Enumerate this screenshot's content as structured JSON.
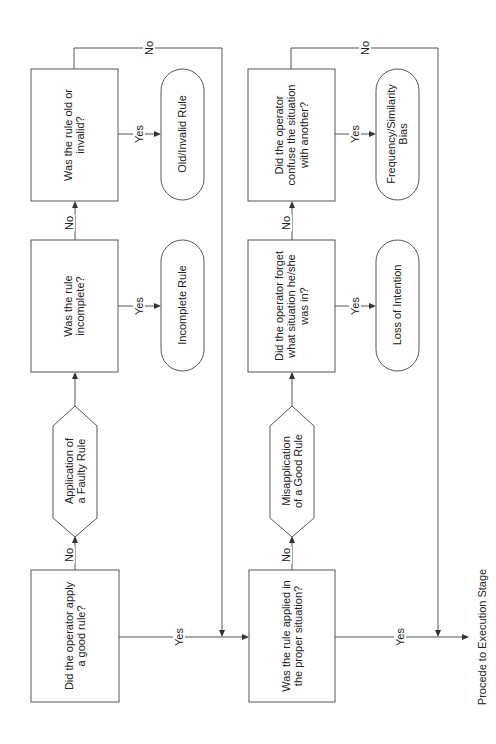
{
  "diagram": {
    "decisions": {
      "good_rule": [
        "Did the operator apply",
        "a good rule?"
      ],
      "incomplete": [
        "Was the rule",
        "incomplete?"
      ],
      "old_invalid": [
        "Was the rule old or",
        "invalid?"
      ],
      "proper_situation": [
        "Was the rule applied in",
        "the proper situation?"
      ],
      "forget": [
        "Did the operator forget",
        "what situation he/she",
        "was in?"
      ],
      "confuse": [
        "Did the operator",
        "confuse the situation",
        "with another?"
      ]
    },
    "processes": {
      "faulty_rule": [
        "Application of",
        "a Faulty Rule"
      ],
      "misapplication": [
        "Misapplication",
        "of a Good Rule"
      ]
    },
    "outcomes": {
      "incomplete_rule": [
        "Incomplete Rule"
      ],
      "old_invalid_rule": [
        "Old/Invalid Rule"
      ],
      "loss_of_intention": [
        "Loss of Intention"
      ],
      "frequency_bias": [
        "Frequency/Similarity",
        "Bias"
      ]
    },
    "labels": {
      "yes": "Yes",
      "no": "No"
    },
    "terminal": "Procede to Execution Stage"
  }
}
